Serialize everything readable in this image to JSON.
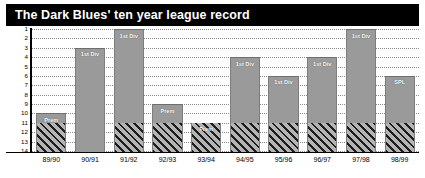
{
  "title": "The Dark Blues' ten year league record",
  "colors": {
    "title_bar_background": "#000000",
    "title_text": "#ffffff",
    "bar_fill": "#9a9a9a",
    "hatch_dark": "#1d1d1d",
    "hatch_light": "#b4b4b4",
    "gridline": "#8a8a8a",
    "axis": "#000000",
    "bar_label_text": "#ffffff"
  },
  "chart_data": {
    "type": "bar",
    "title": "The Dark Blues' ten year league record",
    "xlabel": "",
    "ylabel": "",
    "ylim": [
      1,
      14
    ],
    "y_inverted": true,
    "grid": true,
    "legend": "none",
    "y_ticks": [
      "1",
      "2",
      "3",
      "4",
      "5",
      "6",
      "7",
      "8",
      "9",
      "10",
      "11",
      "12",
      "13",
      "14"
    ],
    "categories": [
      "89/90",
      "90/91",
      "91/92",
      "92/93",
      "93/94",
      "94/95",
      "95/96",
      "96/97",
      "97/98",
      "98/99"
    ],
    "values": [
      10,
      3,
      1,
      9,
      11,
      4,
      6,
      4,
      1,
      6
    ],
    "point_labels": [
      "Prem",
      "1st Div",
      "1st Div",
      "Prem",
      "Prem",
      "1st Div",
      "1st Div",
      "1st Div",
      "1st Div",
      "SPL"
    ],
    "hatched": [
      true,
      false,
      true,
      true,
      true,
      true,
      true,
      true,
      true,
      true
    ],
    "hatch_start_position": 11,
    "annotations": [
      {
        "category": "89/90",
        "value": 10,
        "label": "Prem"
      },
      {
        "category": "90/91",
        "value": 3,
        "label": "1st Div"
      },
      {
        "category": "91/92",
        "value": 1,
        "label": "1st Div"
      },
      {
        "category": "92/93",
        "value": 9,
        "label": "Prem"
      },
      {
        "category": "93/94",
        "value": 11,
        "label": "Prem"
      },
      {
        "category": "94/95",
        "value": 4,
        "label": "1st Div"
      },
      {
        "category": "95/96",
        "value": 6,
        "label": "1st Div"
      },
      {
        "category": "96/97",
        "value": 4,
        "label": "1st Div"
      },
      {
        "category": "97/98",
        "value": 1,
        "label": "1st Div"
      },
      {
        "category": "98/99",
        "value": 6,
        "label": "SPL"
      }
    ]
  }
}
